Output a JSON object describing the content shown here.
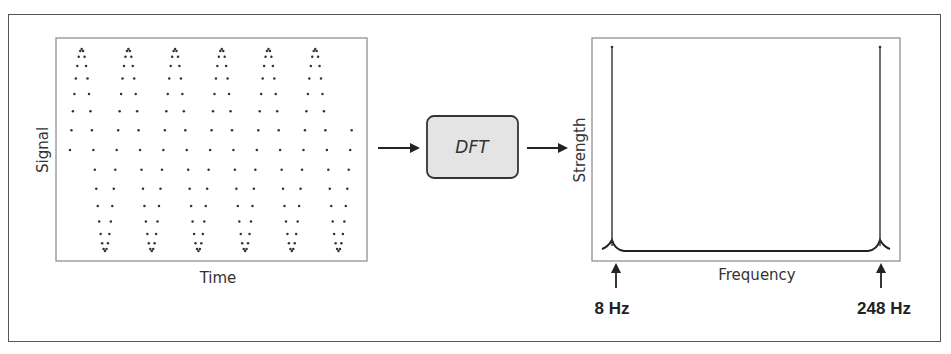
{
  "diagram": {
    "left_panel": {
      "ylabel": "Signal",
      "xlabel": "Time"
    },
    "process_box": {
      "label": "DFT"
    },
    "right_panel": {
      "ylabel": "Strength",
      "xlabel": "Frequency",
      "annotations": [
        "8 Hz",
        "248 Hz"
      ]
    },
    "colors": {
      "ink": "#2a2a2a",
      "box_fill": "#e4e4e4",
      "frame": "#555555"
    }
  },
  "chart_data": [
    {
      "type": "scatter",
      "title": "",
      "xlabel": "Time",
      "ylabel": "Signal",
      "signal": {
        "form": "sine",
        "frequency_hz": 8,
        "sample_rate_hz": 256,
        "cycles_shown": 6,
        "amplitude": 1
      },
      "grid": false
    },
    {
      "type": "line",
      "title": "",
      "xlabel": "Frequency",
      "ylabel": "Strength",
      "peaks_hz": [
        8,
        248
      ],
      "x_range_hz": [
        8,
        248
      ],
      "annotations": [
        "8 Hz",
        "248 Hz"
      ],
      "grid": false
    }
  ]
}
